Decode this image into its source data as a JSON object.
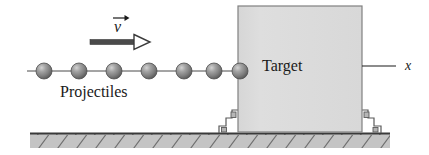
{
  "figure": {
    "labels": {
      "projectiles": "Projectiles",
      "target": "Target",
      "velocity": "v",
      "axis": "x"
    },
    "colors": {
      "ink": "#1a1a1a",
      "ball_fill": "#8a8a8a",
      "ball_highlight": "#c8c8c8",
      "ball_shadow": "#5a5a5a",
      "block_fill": "#dcdcdc",
      "block_stroke": "#808080",
      "ground_fill": "#c4c4c4",
      "ground_stroke": "#3a3a3a",
      "hatch_stroke": "#6e6e6e",
      "arrow_fill": "#ffffff",
      "arrow_stroke": "#3a3a3a"
    },
    "geometry": {
      "ball_count": 7,
      "ball_first_x": 44,
      "ball_spacing": 35,
      "ball_cy": 71,
      "ball_r": 8,
      "chain_x1": 27,
      "chain_x2": 245,
      "block_x": 238,
      "block_y": 6,
      "block_w": 124,
      "block_h": 126,
      "ground_y": 133,
      "ground_h": 15,
      "ground_x1": 30,
      "ground_x2": 390,
      "hatch_count": 19,
      "velocity_arrow_x1": 90,
      "velocity_arrow_x2": 148,
      "velocity_arrow_y": 42,
      "axis_line_x1": 362,
      "axis_line_x2": 396,
      "axis_line_y": 66
    }
  }
}
